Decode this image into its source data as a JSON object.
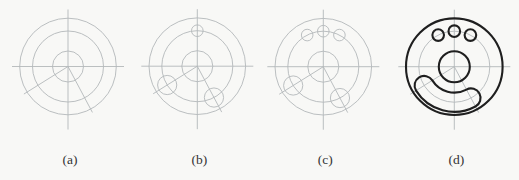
{
  "figure": {
    "panels": [
      {
        "key": "a",
        "label": "(a)",
        "cx": 68.0,
        "cy": 66.5,
        "construction_circles": true,
        "top_holes": 0,
        "slot_end_circles": false,
        "final_outline": false
      },
      {
        "key": "b",
        "label": "(b)",
        "cx": 197.3,
        "cy": 66.2,
        "construction_circles": true,
        "top_holes": 1,
        "slot_end_circles": true,
        "final_outline": false
      },
      {
        "key": "c",
        "label": "(c)",
        "cx": 323.3,
        "cy": 66.7,
        "construction_circles": true,
        "top_holes": 3,
        "slot_end_circles": true,
        "final_outline": false
      },
      {
        "key": "d",
        "label": "(d)",
        "cx": 454.3,
        "cy": 66.7,
        "construction_circles": false,
        "top_holes": 0,
        "slot_end_circles": false,
        "final_outline": true
      }
    ],
    "geometry": {
      "outer_radius": 48.3,
      "pitch_radius": 35.5,
      "hub_radius": 15.5,
      "finger_hole_radius": 5.8,
      "slot_half_width": 9.6,
      "top_hole_angles_deg": [
        63,
        90,
        117
      ],
      "slot_angles_deg": [
        212,
        298
      ],
      "radial_line_angles_deg": [
        212,
        298
      ],
      "radial_line_length": 52,
      "centerline_extent_horizontal": 56,
      "centerline_extent_top": 57,
      "centerline_extent_bottom": 63,
      "label_baseline_y": 164
    },
    "colors": {
      "background": "#f8f8f6",
      "construction_line": "#b3b8ba",
      "outline": "#1f1f1f",
      "label_text": "#333333"
    },
    "stroke_widths": {
      "construction": 0.9,
      "outline": 2.1
    }
  }
}
